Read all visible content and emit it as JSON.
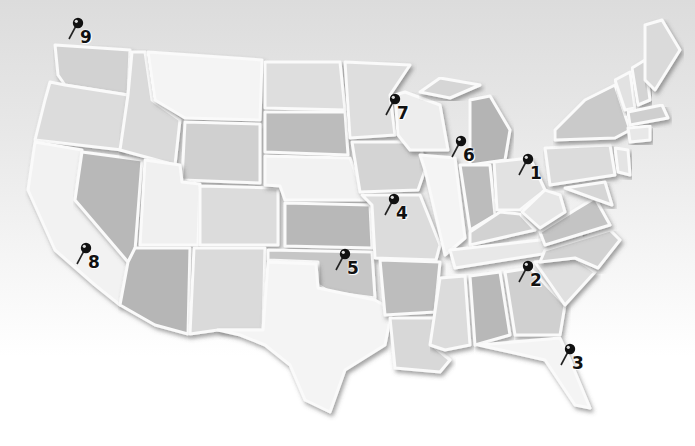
{
  "map": {
    "title": "United States map with numbered pins",
    "colors": {
      "light": "#efefef",
      "mid": "#d2d2d2",
      "dark": "#b4b4b4",
      "pin": "#111111"
    },
    "pins": [
      {
        "label": "1",
        "x": 528,
        "y": 165
      },
      {
        "label": "2",
        "x": 528,
        "y": 272
      },
      {
        "label": "3",
        "x": 570,
        "y": 355
      },
      {
        "label": "4",
        "x": 394,
        "y": 205
      },
      {
        "label": "5",
        "x": 345,
        "y": 260
      },
      {
        "label": "6",
        "x": 461,
        "y": 147
      },
      {
        "label": "7",
        "x": 395,
        "y": 105
      },
      {
        "label": "8",
        "x": 86,
        "y": 254
      },
      {
        "label": "9",
        "x": 78,
        "y": 29
      }
    ]
  }
}
